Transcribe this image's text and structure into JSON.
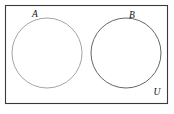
{
  "figure": {
    "type": "venn-diagram",
    "background_color": "#ffffff",
    "universe": {
      "label": "U",
      "shape": "rectangle",
      "border_color": "#3a3a3a",
      "fill_color": "#ffffff",
      "x": 5.5,
      "y": 5.5,
      "width": 162,
      "height": 98,
      "label_x": 157,
      "label_y": 95
    },
    "sets": [
      {
        "label": "A",
        "shape": "circle",
        "stroke_color": "#9a9a9a",
        "fill_color": "none",
        "cx": 47,
        "cy": 53,
        "r": 35,
        "label_x": 35,
        "label_y": 17
      },
      {
        "label": "B",
        "shape": "circle",
        "stroke_color": "#555555",
        "fill_color": "none",
        "cx": 126,
        "cy": 53,
        "r": 35,
        "label_x": 132,
        "label_y": 18
      }
    ]
  }
}
